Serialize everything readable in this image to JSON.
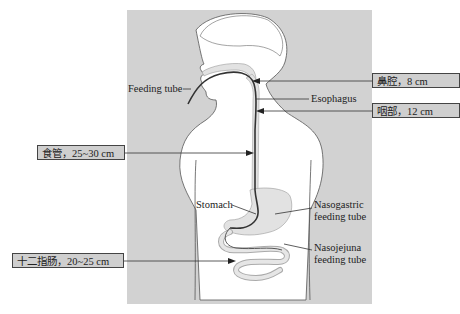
{
  "diagram": {
    "labels": {
      "feeding_tube": "Feeding tube",
      "esophagus": "Esophagus",
      "stomach": "Stomach",
      "nasogastric_line1": "Nasogastric",
      "nasogastric_line2": "feeding tube",
      "nasojejuna_line1": "Nasojejuna",
      "nasojejuna_line2": "feeding tube"
    },
    "callouts": [
      {
        "text": "鼻腔，8 cm",
        "segment": "nasal cavity"
      },
      {
        "text": "咽部，12 cm",
        "segment": "pharynx"
      },
      {
        "text": "食管，25~30 cm",
        "segment": "esophagus"
      },
      {
        "text": "十二指肠，20~25 cm",
        "segment": "duodenum"
      }
    ],
    "colors": {
      "panel": "#d2d2d2",
      "body": "#ffffff",
      "organ": "#e2e2e2",
      "tube": "#333333",
      "box": "#cfcfcf"
    }
  }
}
